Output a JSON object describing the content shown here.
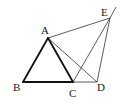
{
  "figure": {
    "points": [
      {
        "name": "A",
        "x": 48,
        "y": 38,
        "label_x": 41,
        "label_y": 34
      },
      {
        "name": "B",
        "x": 23,
        "y": 82,
        "label_x": 13,
        "label_y": 91
      },
      {
        "name": "C",
        "x": 73,
        "y": 82,
        "label_x": 69,
        "label_y": 97
      },
      {
        "name": "D",
        "x": 97,
        "y": 82,
        "label_x": 97,
        "label_y": 91
      },
      {
        "name": "E",
        "x": 110,
        "y": 18,
        "label_x": 101,
        "label_y": 16
      }
    ],
    "bold_segments": [
      [
        "A",
        "B"
      ],
      [
        "A",
        "C"
      ],
      [
        "B",
        "C"
      ]
    ],
    "thin_segments": [
      [
        "C",
        "D"
      ],
      [
        "A",
        "D"
      ],
      [
        "A",
        "E"
      ],
      [
        "C",
        "E"
      ],
      [
        "D",
        "E"
      ]
    ],
    "extension": {
      "from": "E",
      "to_x": 116,
      "to_y": 7
    },
    "stroke_color": "#222222"
  }
}
